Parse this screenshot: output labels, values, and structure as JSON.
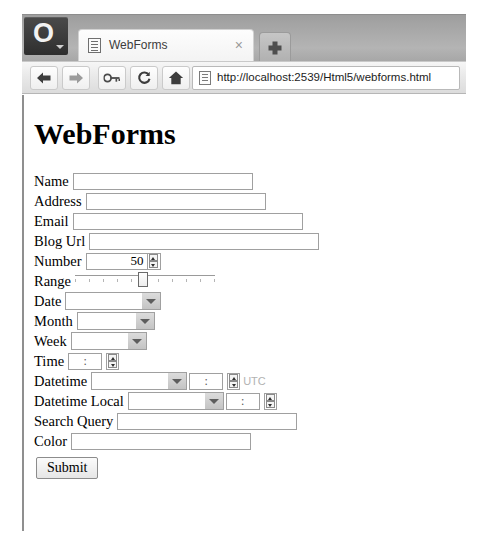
{
  "browser": {
    "menu_button_glyph": "O",
    "tab": {
      "title": "WebForms",
      "close_label": "×"
    },
    "new_tab_label": "+",
    "toolbar": {
      "back_label": "Back",
      "forward_label": "Forward",
      "key_label": "Key",
      "reload_label": "Reload",
      "home_label": "Home"
    },
    "address": {
      "url": "http://localhost:2539/Html5/webforms.html"
    }
  },
  "page": {
    "title": "WebForms",
    "fields": [
      {
        "label": "Name",
        "type": "text",
        "value": "",
        "placeholder": ""
      },
      {
        "label": "Address",
        "type": "text",
        "value": "",
        "placeholder": ""
      },
      {
        "label": "Email",
        "type": "email",
        "value": "",
        "placeholder": ""
      },
      {
        "label": "Blog Url",
        "type": "url",
        "value": "",
        "placeholder": ""
      },
      {
        "label": "Number",
        "type": "number",
        "value": "50",
        "placeholder": ""
      },
      {
        "label": "Range",
        "type": "range",
        "value": "50",
        "min": "0",
        "max": "100"
      },
      {
        "label": "Date",
        "type": "date",
        "value": "",
        "placeholder": ""
      },
      {
        "label": "Month",
        "type": "month",
        "value": "",
        "placeholder": ""
      },
      {
        "label": "Week",
        "type": "week",
        "value": "",
        "placeholder": ""
      },
      {
        "label": "Time",
        "type": "time",
        "value": ":",
        "placeholder": ""
      },
      {
        "label": "Datetime",
        "type": "datetime",
        "value": ":",
        "suffix": "UTC"
      },
      {
        "label": "Datetime Local",
        "type": "datetime-local",
        "value": ":",
        "placeholder": ""
      },
      {
        "label": "Search Query",
        "type": "search",
        "value": "",
        "placeholder": ""
      },
      {
        "label": "Color",
        "type": "color",
        "value": "",
        "placeholder": ""
      }
    ],
    "submit_label": "Submit"
  },
  "colors": {
    "chrome": "#a9a9a9",
    "toolbar": "#e8e8e8",
    "page_background": "#ffffff",
    "field_border": "#a0a0a0",
    "muted_text": "#b2b2b2"
  }
}
